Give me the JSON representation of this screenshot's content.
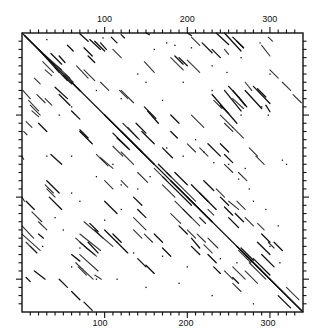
{
  "chart_data": {
    "type": "scatter",
    "subtype": "dot-plot (sequence self-comparison matrix)",
    "title": "",
    "xlabel": "",
    "ylabel": "",
    "xlim": [
      0,
      340
    ],
    "ylim": [
      0,
      340
    ],
    "grid": false,
    "legend": null,
    "x_axis": {
      "top_tick_labels": [
        "100",
        "200",
        "300"
      ],
      "top_tick_values": [
        100,
        200,
        300
      ],
      "bottom_tick_labels": [
        "100",
        "200",
        "300"
      ],
      "bottom_tick_values": [
        100,
        200,
        300
      ],
      "minor_tick_step": 10
    },
    "y_axis": {
      "left_tick_labels": [],
      "right_tick_labels": [],
      "major_tick_values": [
        100,
        200,
        300
      ],
      "minor_tick_step": 10
    },
    "main_diagonal": {
      "from": [
        0,
        0
      ],
      "to": [
        340,
        340
      ]
    },
    "segments": [
      [
        3,
        3,
        40,
        40
      ],
      [
        20,
        20,
        45,
        48
      ],
      [
        50,
        52,
        60,
        62
      ],
      [
        40,
        42,
        55,
        58
      ],
      [
        35,
        25,
        48,
        38
      ],
      [
        45,
        28,
        52,
        36
      ],
      [
        70,
        1,
        80,
        10
      ],
      [
        55,
        15,
        62,
        22
      ],
      [
        75,
        18,
        85,
        28
      ],
      [
        80,
        28,
        88,
        36
      ],
      [
        82,
        8,
        95,
        20
      ],
      [
        88,
        10,
        100,
        22
      ],
      [
        95,
        12,
        102,
        20
      ],
      [
        108,
        5,
        115,
        12
      ],
      [
        120,
        2,
        124,
        6
      ],
      [
        150,
        -2,
        154,
        2
      ],
      [
        185,
        28,
        195,
        38
      ],
      [
        190,
        30,
        200,
        40
      ],
      [
        218,
        12,
        230,
        24
      ],
      [
        230,
        20,
        240,
        30
      ],
      [
        235,
        0,
        250,
        14
      ],
      [
        245,
        0,
        265,
        22
      ],
      [
        255,
        5,
        268,
        18
      ],
      [
        260,
        10,
        268,
        18
      ],
      [
        270,
        70,
        290,
        92
      ],
      [
        280,
        65,
        300,
        86
      ],
      [
        285,
        68,
        295,
        78
      ],
      [
        262,
        78,
        272,
        90
      ],
      [
        230,
        75,
        260,
        110
      ],
      [
        245,
        70,
        265,
        95
      ],
      [
        250,
        65,
        262,
        78
      ],
      [
        255,
        70,
        270,
        88
      ],
      [
        240,
        88,
        250,
        98
      ],
      [
        295,
        88,
        300,
        96
      ],
      [
        70,
        118,
        80,
        128
      ],
      [
        70,
        120,
        85,
        135
      ],
      [
        100,
        100,
        145,
        145
      ],
      [
        120,
        120,
        160,
        160
      ],
      [
        110,
        122,
        128,
        140
      ],
      [
        115,
        128,
        130,
        142
      ],
      [
        138,
        110,
        150,
        122
      ],
      [
        145,
        120,
        160,
        135
      ],
      [
        148,
        90,
        162,
        104
      ],
      [
        152,
        95,
        165,
        110
      ],
      [
        40,
        66,
        55,
        80
      ],
      [
        45,
        75,
        58,
        88
      ],
      [
        60,
        95,
        70,
        105
      ],
      [
        20,
        110,
        30,
        120
      ],
      [
        35,
        148,
        48,
        160
      ],
      [
        30,
        180,
        45,
        195
      ],
      [
        33,
        200,
        48,
        215
      ],
      [
        5,
        205,
        15,
        215
      ],
      [
        100,
        205,
        115,
        220
      ],
      [
        100,
        240,
        115,
        255
      ],
      [
        110,
        245,
        120,
        255
      ],
      [
        115,
        255,
        128,
        268
      ],
      [
        80,
        255,
        92,
        268
      ],
      [
        82,
        232,
        92,
        242
      ],
      [
        60,
        270,
        70,
        278
      ],
      [
        15,
        290,
        28,
        300
      ],
      [
        45,
        300,
        55,
        310
      ],
      [
        60,
        315,
        70,
        325
      ],
      [
        75,
        328,
        85,
        338
      ],
      [
        5,
        298,
        10,
        303
      ],
      [
        165,
        160,
        180,
        175
      ],
      [
        170,
        175,
        205,
        210
      ],
      [
        180,
        180,
        210,
        210
      ],
      [
        185,
        170,
        200,
        185
      ],
      [
        200,
        200,
        230,
        230
      ],
      [
        205,
        185,
        225,
        205
      ],
      [
        215,
        195,
        235,
        215
      ],
      [
        220,
        180,
        232,
        192
      ],
      [
        250,
        225,
        262,
        237
      ],
      [
        258,
        220,
        268,
        230
      ],
      [
        240,
        200,
        250,
        210
      ],
      [
        245,
        212,
        255,
        222
      ],
      [
        260,
        260,
        290,
        290
      ],
      [
        265,
        262,
        280,
        277
      ],
      [
        270,
        270,
        300,
        300
      ],
      [
        280,
        275,
        300,
        295
      ],
      [
        300,
        300,
        338,
        338
      ],
      [
        310,
        320,
        325,
        335
      ],
      [
        285,
        255,
        300,
        270
      ],
      [
        290,
        245,
        300,
        255
      ],
      [
        290,
        270,
        305,
        285
      ],
      [
        305,
        255,
        315,
        265
      ],
      [
        215,
        225,
        222,
        232
      ],
      [
        190,
        235,
        200,
        245
      ],
      [
        160,
        245,
        170,
        255
      ],
      [
        170,
        262,
        180,
        272
      ],
      [
        140,
        275,
        150,
        285
      ],
      [
        150,
        283,
        160,
        293
      ],
      [
        205,
        260,
        215,
        270
      ],
      [
        225,
        270,
        235,
        280
      ],
      [
        232,
        285,
        240,
        293
      ],
      [
        255,
        298,
        262,
        305
      ],
      [
        170,
        140,
        182,
        152
      ],
      [
        180,
        120,
        188,
        128
      ],
      [
        180,
        100,
        190,
        110
      ],
      [
        205,
        250,
        215,
        262
      ],
      [
        225,
        135,
        240,
        150
      ],
      [
        240,
        135,
        250,
        145
      ],
      [
        245,
        148,
        255,
        158
      ],
      [
        20,
        245,
        26,
        250
      ],
      [
        200,
        -1,
        205,
        3
      ],
      [
        60,
        60,
        70,
        70
      ],
      [
        135,
        200,
        145,
        210
      ],
      [
        140,
        215,
        150,
        225
      ]
    ],
    "dots": [
      [
        30,
        8
      ],
      [
        98,
        6
      ],
      [
        160,
        20
      ],
      [
        175,
        12
      ],
      [
        185,
        15
      ],
      [
        205,
        18
      ],
      [
        230,
        40
      ],
      [
        248,
        48
      ],
      [
        265,
        30
      ],
      [
        288,
        12
      ],
      [
        300,
        50
      ],
      [
        60,
        90
      ],
      [
        45,
        100
      ],
      [
        30,
        150
      ],
      [
        60,
        150
      ],
      [
        90,
        70
      ],
      [
        140,
        50
      ],
      [
        150,
        60
      ],
      [
        120,
        80
      ],
      [
        170,
        82
      ],
      [
        195,
        60
      ],
      [
        230,
        70
      ],
      [
        265,
        100
      ],
      [
        290,
        90
      ],
      [
        298,
        100
      ],
      [
        210,
        130
      ],
      [
        175,
        140
      ],
      [
        195,
        150
      ],
      [
        250,
        160
      ],
      [
        270,
        165
      ],
      [
        110,
        160
      ],
      [
        90,
        175
      ],
      [
        120,
        185
      ],
      [
        140,
        190
      ],
      [
        155,
        175
      ],
      [
        60,
        195
      ],
      [
        70,
        205
      ],
      [
        100,
        228
      ],
      [
        120,
        215
      ],
      [
        40,
        225
      ],
      [
        50,
        240
      ],
      [
        25,
        260
      ],
      [
        70,
        262
      ],
      [
        135,
        268
      ],
      [
        170,
        272
      ],
      [
        200,
        285
      ],
      [
        240,
        275
      ],
      [
        260,
        280
      ],
      [
        300,
        260
      ],
      [
        312,
        280
      ],
      [
        60,
        285
      ],
      [
        90,
        300
      ],
      [
        115,
        300
      ],
      [
        150,
        310
      ],
      [
        190,
        305
      ],
      [
        230,
        320
      ],
      [
        280,
        330
      ],
      [
        220,
        145
      ],
      [
        232,
        158
      ],
      [
        262,
        178
      ],
      [
        275,
        190
      ],
      [
        280,
        205
      ],
      [
        295,
        215
      ],
      [
        310,
        235
      ],
      [
        315,
        155
      ],
      [
        320,
        160
      ]
    ],
    "colors": {
      "ink": "#111111",
      "background": "#ffffff",
      "frame": "#111111"
    }
  }
}
